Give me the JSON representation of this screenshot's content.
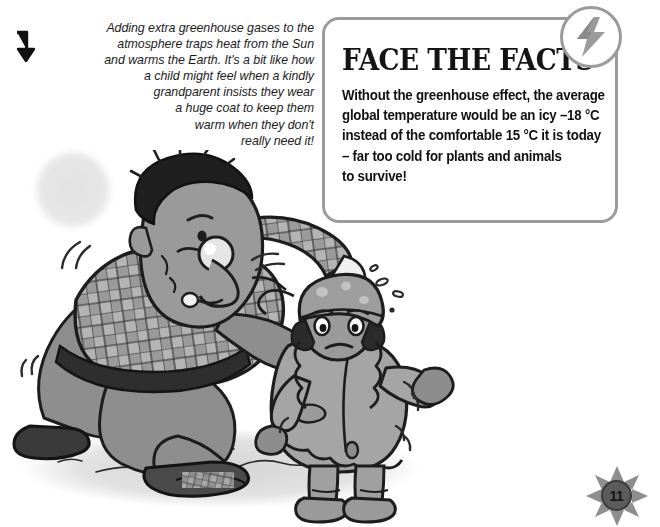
{
  "page": {
    "background_color": "#ffffff",
    "page_number": "11"
  },
  "caption": {
    "arrow_icon": "down-arrow-icon",
    "lines": [
      "Adding extra greenhouse gases to the",
      "atmosphere traps heat from the Sun",
      "and warms the Earth. It's a bit like how",
      "a child might feel when a kindly",
      "grandparent insists they wear",
      "a huge coat to keep them",
      "warm when they don't",
      "really need it!"
    ]
  },
  "facts_panel": {
    "title": "FACE THE FACTS",
    "badge_icon": "lightning-bolt-icon",
    "border_color": "#9b9b9b",
    "body_lines": [
      "Without the greenhouse effect, the average",
      "global temperature would be an icy –18 °C",
      "instead of the comfortable 15 °C it is today",
      "– far too cold for plants and animals",
      "to survive!"
    ]
  },
  "illustration": {
    "name": "grandparent-and-child-cartoon",
    "description": "Grayscale cartoon of a kneeling grandparent in a checked jumper gesturing to a child bundled in a huge winter coat and woolly hat",
    "sun_glow": "faint-sun-icon"
  }
}
